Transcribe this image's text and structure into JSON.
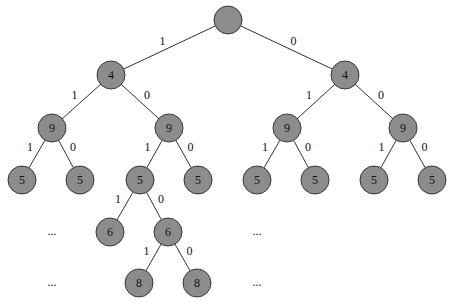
{
  "diagram": {
    "type": "binary-tree",
    "node_radius": 14,
    "colors": {
      "node_fill": "#8c8c8c",
      "node_stroke": "#3a3a3a",
      "edge": "#333333"
    },
    "nodes": [
      {
        "id": "root",
        "label": "",
        "x": 228,
        "y": 20
      },
      {
        "id": "L",
        "label": "4",
        "x": 111,
        "y": 75
      },
      {
        "id": "R",
        "label": "4",
        "x": 345,
        "y": 75
      },
      {
        "id": "LL",
        "label": "9",
        "x": 52,
        "y": 128
      },
      {
        "id": "LR",
        "label": "9",
        "x": 169,
        "y": 128
      },
      {
        "id": "RL",
        "label": "9",
        "x": 287,
        "y": 128
      },
      {
        "id": "RR",
        "label": "9",
        "x": 403,
        "y": 128
      },
      {
        "id": "LLL",
        "label": "5",
        "x": 22,
        "y": 180
      },
      {
        "id": "LLR",
        "label": "5",
        "x": 80,
        "y": 180
      },
      {
        "id": "LRL",
        "label": "5",
        "x": 140,
        "y": 180
      },
      {
        "id": "LRR",
        "label": "5",
        "x": 198,
        "y": 180
      },
      {
        "id": "RLL",
        "label": "5",
        "x": 257,
        "y": 180
      },
      {
        "id": "RLR",
        "label": "5",
        "x": 315,
        "y": 180
      },
      {
        "id": "RRL",
        "label": "5",
        "x": 374,
        "y": 180
      },
      {
        "id": "RRR",
        "label": "5",
        "x": 432,
        "y": 180
      },
      {
        "id": "LRLL",
        "label": "6",
        "x": 110,
        "y": 232
      },
      {
        "id": "LRLR",
        "label": "6",
        "x": 168,
        "y": 232
      },
      {
        "id": "LRLRL",
        "label": "8",
        "x": 139,
        "y": 283
      },
      {
        "id": "LRLRR",
        "label": "8",
        "x": 197,
        "y": 283
      }
    ],
    "edges": [
      {
        "from": "root",
        "to": "L",
        "label": "1"
      },
      {
        "from": "root",
        "to": "R",
        "label": "0"
      },
      {
        "from": "L",
        "to": "LL",
        "label": "1"
      },
      {
        "from": "L",
        "to": "LR",
        "label": "0"
      },
      {
        "from": "R",
        "to": "RL",
        "label": "1"
      },
      {
        "from": "R",
        "to": "RR",
        "label": "0"
      },
      {
        "from": "LL",
        "to": "LLL",
        "label": "1"
      },
      {
        "from": "LL",
        "to": "LLR",
        "label": "0"
      },
      {
        "from": "LR",
        "to": "LRL",
        "label": "1"
      },
      {
        "from": "LR",
        "to": "LRR",
        "label": "0"
      },
      {
        "from": "RL",
        "to": "RLL",
        "label": "1"
      },
      {
        "from": "RL",
        "to": "RLR",
        "label": "0"
      },
      {
        "from": "RR",
        "to": "RRL",
        "label": "1"
      },
      {
        "from": "RR",
        "to": "RRR",
        "label": "0"
      },
      {
        "from": "LRL",
        "to": "LRLL",
        "label": "1"
      },
      {
        "from": "LRL",
        "to": "LRLR",
        "label": "0"
      },
      {
        "from": "LRLR",
        "to": "LRLRL",
        "label": "1"
      },
      {
        "from": "LRLR",
        "to": "LRLRR",
        "label": "0"
      }
    ],
    "ellipses": [
      {
        "text": "...",
        "x": 52,
        "y": 232
      },
      {
        "text": "...",
        "x": 257,
        "y": 232
      },
      {
        "text": "...",
        "x": 52,
        "y": 283
      },
      {
        "text": "...",
        "x": 257,
        "y": 283
      }
    ]
  }
}
